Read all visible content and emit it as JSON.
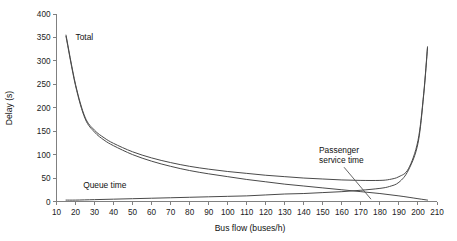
{
  "chart_data": {
    "type": "line",
    "title": "",
    "xlabel": "Bus flow (buses/h)",
    "ylabel": "Delay (s)",
    "xlim": [
      10,
      210
    ],
    "ylim": [
      0,
      400
    ],
    "xticks": [
      10,
      20,
      30,
      40,
      50,
      60,
      70,
      80,
      90,
      100,
      110,
      120,
      130,
      140,
      150,
      160,
      170,
      180,
      190,
      200,
      210
    ],
    "yticks": [
      0,
      50,
      100,
      150,
      200,
      250,
      300,
      350,
      400
    ],
    "grid": false,
    "legend_position": "inline-annotations",
    "series": [
      {
        "name": "Total",
        "annotation_label": "Total",
        "x": [
          15,
          20,
          25,
          30,
          35,
          40,
          50,
          60,
          70,
          80,
          90,
          100,
          110,
          120,
          130,
          140,
          150,
          160,
          170,
          180,
          185,
          190,
          195,
          200,
          203,
          205
        ],
        "values": [
          355,
          250,
          180,
          152,
          136,
          124,
          106,
          93,
          83,
          75,
          69,
          64,
          60,
          56,
          53,
          50,
          48,
          46,
          45,
          45,
          47,
          53,
          70,
          130,
          230,
          330
        ]
      },
      {
        "name": "Passenger service time",
        "annotation_label": "Passenger service time",
        "x": [
          15,
          20,
          25,
          30,
          35,
          40,
          50,
          60,
          70,
          80,
          90,
          100,
          110,
          120,
          130,
          140,
          150,
          160,
          170,
          180,
          190,
          200,
          205
        ],
        "values": [
          352,
          247,
          177,
          148,
          131,
          119,
          100,
          86,
          75,
          66,
          59,
          53,
          47,
          42,
          37,
          33,
          29,
          25,
          21,
          17,
          12,
          6,
          3
        ]
      },
      {
        "name": "Queue time",
        "annotation_label": "Queue time",
        "x": [
          15,
          20,
          30,
          40,
          50,
          60,
          70,
          80,
          90,
          100,
          110,
          120,
          130,
          140,
          150,
          160,
          170,
          180,
          185,
          190,
          195,
          200,
          203,
          205
        ],
        "values": [
          3,
          3,
          4,
          5,
          6,
          7,
          8,
          9,
          10,
          11,
          12,
          14,
          16,
          17,
          19,
          21,
          24,
          28,
          32,
          41,
          67,
          124,
          227,
          327
        ]
      }
    ],
    "annotations": [
      {
        "text": "Total",
        "x": 20,
        "y": 345
      },
      {
        "text": "Passenger service time",
        "x": 148,
        "y": 103
      },
      {
        "text": "Queue time",
        "x": 24,
        "y": 28
      }
    ]
  },
  "colors": {
    "curve": "#4a4a4a",
    "axis": "#808080",
    "text": "#111111",
    "background": "#ffffff"
  }
}
